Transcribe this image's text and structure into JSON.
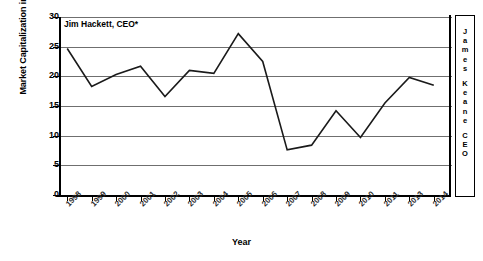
{
  "chart_data": {
    "type": "line",
    "title": "",
    "xlabel": "Year",
    "ylabel": "Market Capitalization in Billions (USD)",
    "ylim": [
      0,
      30
    ],
    "yticks": [
      0,
      5,
      10,
      15,
      20,
      25,
      30
    ],
    "ytick_labels": [
      "0",
      "5",
      "10",
      "15",
      "20",
      "25",
      "30"
    ],
    "grid": true,
    "legend": "none",
    "categories": [
      "1998",
      "1999",
      "2000",
      "2001",
      "2002",
      "2003",
      "2004",
      "2005",
      "2006",
      "2007",
      "2008",
      "2009",
      "2010",
      "2011",
      "2013",
      "2014"
    ],
    "xtick_labels": [
      "1998",
      "1999",
      "2000",
      "2001",
      "2002",
      "2003",
      "2004",
      "2005",
      "2006",
      "2007",
      "2008",
      "2009",
      "2010",
      "2011",
      "2013",
      "2014"
    ],
    "series": [
      {
        "name": "Market Capitalization",
        "values": [
          24.7,
          18.3,
          20.3,
          21.7,
          16.6,
          21.0,
          20.5,
          27.2,
          22.5,
          7.6,
          8.4,
          14.2,
          9.7,
          15.5,
          19.8,
          18.5
        ]
      }
    ],
    "annotations": [
      {
        "name": "jim-hackett",
        "text": "Jim Hackett, CEO*"
      },
      {
        "name": "james-keane",
        "text": "James Keane CEO",
        "orientation": "vertical-stacked"
      }
    ],
    "colors": {
      "line": "#1a1a1a",
      "grid": "#6f6f6f",
      "axis": "#000000",
      "background": "#ffffff"
    }
  },
  "annotations": {
    "hackett_label": "Jim Hackett, CEO*",
    "keane_chars": [
      "J",
      "a",
      "m",
      "e",
      "s",
      "K",
      "e",
      "a",
      "n",
      "e",
      "C",
      "E",
      "O"
    ]
  }
}
